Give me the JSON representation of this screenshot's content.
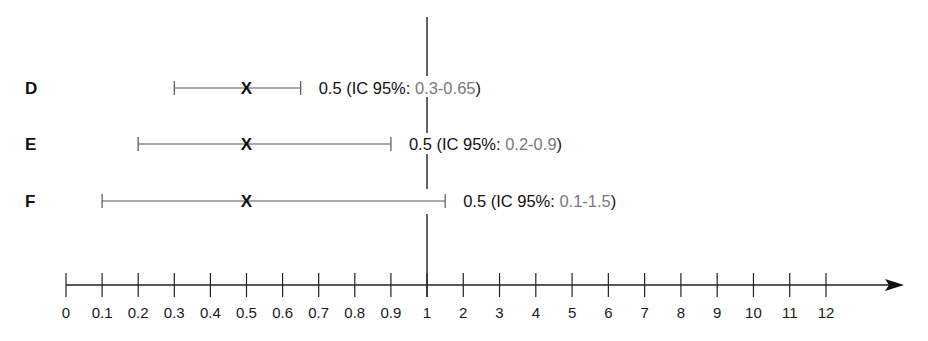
{
  "chart_data": {
    "type": "forest",
    "title": "",
    "xlabel": "",
    "ylabel": "",
    "reference_line": 1,
    "x_ticks": [
      "0",
      "0.1",
      "0.2",
      "0.3",
      "0.4",
      "0.5",
      "0.6",
      "0.7",
      "0.8",
      "0.9",
      "1",
      "2",
      "3",
      "4",
      "5",
      "6",
      "7",
      "8",
      "9",
      "10",
      "11",
      "12"
    ],
    "rows": [
      {
        "label": "D",
        "estimate": 0.5,
        "ci_low": 0.3,
        "ci_high": 0.65,
        "annotation_prefix": "0.5 (IC 95%: ",
        "annotation_ci": "0.3-0.65",
        "annotation_suffix": ")"
      },
      {
        "label": "E",
        "estimate": 0.5,
        "ci_low": 0.2,
        "ci_high": 0.9,
        "annotation_prefix": "0.5 (IC 95%: ",
        "annotation_ci": "0.2-0.9",
        "annotation_suffix": ")"
      },
      {
        "label": "F",
        "estimate": 0.5,
        "ci_low": 0.1,
        "ci_high": 1.5,
        "annotation_prefix": "0.5 (IC 95%: ",
        "annotation_ci": "0.1-1.5",
        "annotation_suffix": ")"
      }
    ],
    "point_marker": "X",
    "grid": false,
    "colors": {
      "line": "#555555",
      "text": "#111111",
      "ci_text": "#7a7a7a"
    }
  }
}
